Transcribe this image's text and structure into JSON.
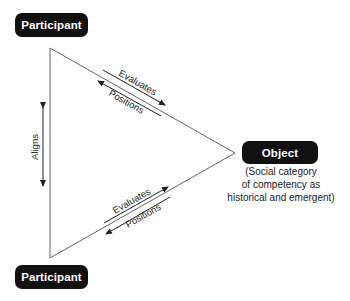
{
  "nodes": {
    "participant_top": {
      "label": "Participant"
    },
    "participant_bottom": {
      "label": "Participant"
    },
    "object": {
      "label": "Object",
      "description_lines": [
        "(Social category",
        "of competency as",
        "historical and emergent)"
      ]
    }
  },
  "edges": {
    "top_edge": {
      "forward_label": "Evaluates",
      "backward_label": "Positions"
    },
    "bottom_edge": {
      "forward_label": "Evaluates",
      "backward_label": "Positions"
    },
    "left_edge": {
      "label": "Aligns"
    }
  },
  "colors": {
    "node_fill": "#111111",
    "node_text": "#ffffff",
    "line": "#555555",
    "arrow": "#222222"
  }
}
